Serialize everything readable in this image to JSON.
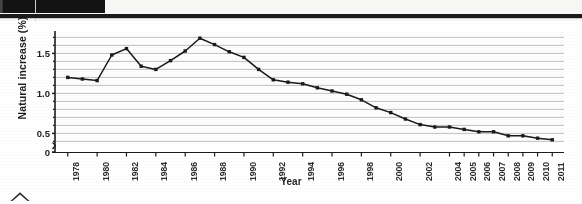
{
  "page": {
    "header_bar_color": "#131313",
    "background": "#ffffff"
  },
  "figure": {
    "xlabel": "Year",
    "ylabel": "Natural increase (%)"
  },
  "chart_data": {
    "type": "line",
    "title": "",
    "xlabel": "Year",
    "ylabel": "Natural increase (%)",
    "xlim": [
      1977.2,
      2011.8
    ],
    "ylim": [
      0,
      1.78
    ],
    "ylim_break_at": 0.38,
    "yticks": [
      0,
      0.5,
      1.0,
      1.5
    ],
    "ytick_labels": [
      "0",
      "0.5",
      "1.0",
      "1.5"
    ],
    "yminor_step": 0.1,
    "grid": "horizontal",
    "grid_step": 0.1,
    "legend": "none",
    "marker": "square",
    "line_color": "#1a1a1a",
    "marker_color": "#1a1a1a",
    "axis_break": true,
    "xtick_labels": [
      "1978",
      "1980",
      "1982",
      "1984",
      "1986",
      "1988",
      "1990",
      "1992",
      "1994",
      "1996",
      "1998",
      "2000",
      "2002",
      "2004",
      "2005",
      "2006",
      "2007",
      "2008",
      "2009",
      "2010",
      "2011"
    ],
    "xtick_values": [
      1978,
      1980,
      1982,
      1984,
      1986,
      1988,
      1990,
      1992,
      1994,
      1996,
      1998,
      2000,
      2002,
      2004,
      2005,
      2006,
      2007,
      2008,
      2009,
      2010,
      2011
    ],
    "x": [
      1978,
      1979,
      1980,
      1981,
      1982,
      1983,
      1984,
      1985,
      1986,
      1987,
      1988,
      1989,
      1990,
      1991,
      1992,
      1993,
      1994,
      1995,
      1996,
      1997,
      1998,
      1999,
      2000,
      2001,
      2002,
      2003,
      2004,
      2005,
      2006,
      2007,
      2008,
      2009,
      2010,
      2011
    ],
    "values": [
      1.2,
      1.18,
      1.16,
      1.48,
      1.56,
      1.34,
      1.3,
      1.41,
      1.53,
      1.69,
      1.61,
      1.52,
      1.45,
      1.3,
      1.17,
      1.14,
      1.12,
      1.07,
      1.03,
      0.99,
      0.92,
      0.82,
      0.76,
      0.68,
      0.61,
      0.58,
      0.58,
      0.55,
      0.52,
      0.52,
      0.47,
      0.47,
      0.44,
      0.42
    ],
    "series": [
      {
        "name": "Natural increase",
        "values": [
          1.2,
          1.18,
          1.16,
          1.48,
          1.56,
          1.34,
          1.3,
          1.41,
          1.53,
          1.69,
          1.61,
          1.52,
          1.45,
          1.3,
          1.17,
          1.14,
          1.12,
          1.07,
          1.03,
          0.99,
          0.92,
          0.82,
          0.76,
          0.68,
          0.61,
          0.58,
          0.58,
          0.55,
          0.52,
          0.52,
          0.47,
          0.47,
          0.44,
          0.42
        ]
      }
    ]
  }
}
